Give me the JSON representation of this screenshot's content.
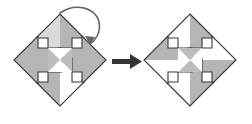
{
  "diagram": {
    "type": "rotation-transformation",
    "title": "",
    "background_color": "#ffffff",
    "fill_gray": "#b3b3b3",
    "fill_light": "#d4d4d4",
    "fill_white": "#ffffff",
    "stroke_color": "#3a3a3a",
    "arrow_color": "#333333",
    "panels": [
      {
        "id": "left-panel",
        "name": "source-figure",
        "label": "",
        "shape_name": "four-arrow-diamond",
        "arm_count": 4,
        "arms": [
          {
            "direction": "up",
            "left_half": "#d4d4d4",
            "right_half": "#b3b3b3"
          },
          {
            "direction": "right",
            "left_half": "#b3b3b3",
            "right_half": "#b3b3b3"
          },
          {
            "direction": "down",
            "left_half": "#b3b3b3",
            "right_half": "#ffffff"
          },
          {
            "direction": "left",
            "left_half": "#b3b3b3",
            "right_half": "#b3b3b3"
          }
        ],
        "center_pattern": "x-bowtie"
      },
      {
        "id": "right-panel",
        "name": "result-figure",
        "label": "",
        "shape_name": "four-arrow-diamond",
        "arm_count": 4,
        "arms": [
          {
            "direction": "up",
            "left_half": "#ffffff",
            "right_half": "#b3b3b3"
          },
          {
            "direction": "right",
            "left_half": "#ffffff",
            "right_half": "#b3b3b3"
          },
          {
            "direction": "down",
            "left_half": "#ffffff",
            "right_half": "#b3b3b3"
          },
          {
            "direction": "left",
            "left_half": "#b3b3b3",
            "right_half": "#ffffff"
          }
        ],
        "center_pattern": "hourglass"
      }
    ],
    "rotation_arrow": {
      "name": "clockwise-rotation-arrow",
      "direction": "clockwise",
      "label": "",
      "color": "#555555"
    },
    "transform_arrow": {
      "name": "transformation-arrow",
      "direction": "right",
      "label": "",
      "color": "#333333"
    }
  }
}
